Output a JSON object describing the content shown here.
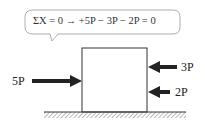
{
  "callout": {
    "equation": "ΣX = 0   →   +5P − 3P − 2P = 0"
  },
  "forces": {
    "left": {
      "label": "5P",
      "direction": "right"
    },
    "right_upper": {
      "label": "3P",
      "direction": "left"
    },
    "right_lower": {
      "label": "2P",
      "direction": "left"
    }
  },
  "colors": {
    "stroke": "#222222",
    "bubble_border": "#999999",
    "hatch": "#888888"
  }
}
